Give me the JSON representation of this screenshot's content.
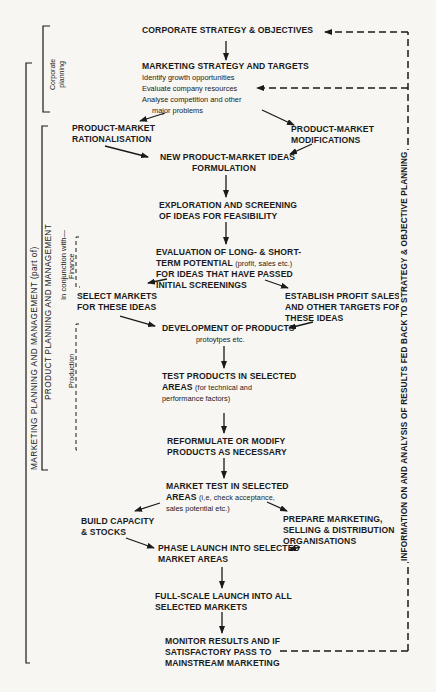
{
  "diagram": {
    "type": "flowchart",
    "nodes": {
      "corporate_strategy": "CORPORATE STRATEGY & OBJECTIVES",
      "marketing_strategy": {
        "title": "MARKETING STRATEGY AND TARGETS",
        "lines": [
          "Identify growth opportunities",
          "Evaluate company resources",
          "Analyse competition and other",
          "major problems"
        ]
      },
      "pm_rationalisation": [
        "PRODUCT-MARKET",
        "RATIONALISATION"
      ],
      "pm_modifications": [
        "PRODUCT-MARKET",
        "MODIFICATIONS"
      ],
      "new_ideas": [
        "NEW PRODUCT-MARKET IDEAS",
        "FORMULATION"
      ],
      "exploration": [
        "EXPLORATION AND SCREENING",
        "OF IDEAS FOR FEASIBILITY"
      ],
      "evaluation": {
        "line1": "EVALUATION OF LONG- & SHORT-",
        "line2_bold": "TERM POTENTIAL",
        "line2_small": "(profit, sales etc.)",
        "line3": "FOR IDEAS THAT HAVE PASSED",
        "line4": "INITIAL SCREENINGS"
      },
      "select_markets": [
        "SELECT MARKETS",
        "FOR THESE IDEAS"
      ],
      "establish_targets": [
        "ESTABLISH PROFIT SALES",
        "AND OTHER TARGETS FOR",
        "THESE IDEAS"
      ],
      "development": {
        "title": "DEVELOPMENT OF PRODUCTS",
        "sub": "protoytpes etc."
      },
      "test_products": {
        "line1": "TEST PRODUCTS IN SELECTED",
        "line2_bold": "AREAS",
        "line2_small": "(for technical and",
        "line3_small": "performance factors)"
      },
      "reformulate": [
        "REFORMULATE OR MODIFY",
        "PRODUCTS AS NECESSARY"
      ],
      "market_test": {
        "line1": "MARKET TEST IN SELECTED",
        "line2_bold": "AREAS",
        "line2_small": "(i,e, check acceptance,",
        "line3_small": "sales potential etc.)"
      },
      "build_capacity": [
        "BUILD CAPACITY",
        "& STOCKS"
      ],
      "prepare_marketing": [
        "PREPARE MARKETING,",
        "SELLING & DISTRIBUTION",
        "ORGANISATIONS"
      ],
      "phase_launch": [
        "PHASE LAUNCH INTO SELECTED",
        "MARKET AREAS"
      ],
      "full_scale": [
        "FULL-SCALE LAUNCH INTO ALL",
        "SELECTED MARKETS"
      ],
      "monitor": [
        "MONITOR RESULTS AND IF",
        "SATISFACTORY PASS TO",
        "MAINSTREAM MARKETING"
      ]
    },
    "side_labels": {
      "corporate_planning": [
        "Corporate",
        "planning"
      ],
      "marketing_planning": "MARKETING PLANNING AND MANAGEMENT (part of)",
      "product_planning": "PRODUCT PLANNING AND MANAGEMENT",
      "in_conjunction": "In conjunction with—",
      "finance": "Finance",
      "production": "Production",
      "feedback": "INFORMATION ON AND ANALYSIS OF RESULTS FED BACK TO STRATEGY & OBJECTIVE PLANNING"
    },
    "edges": [
      [
        "corporate_strategy",
        "marketing_strategy"
      ],
      [
        "marketing_strategy",
        "pm_rationalisation"
      ],
      [
        "marketing_strategy",
        "pm_modifications"
      ],
      [
        "pm_rationalisation",
        "new_ideas"
      ],
      [
        "pm_modifications",
        "new_ideas"
      ],
      [
        "new_ideas",
        "exploration"
      ],
      [
        "exploration",
        "evaluation"
      ],
      [
        "evaluation",
        "select_markets"
      ],
      [
        "evaluation",
        "establish_targets"
      ],
      [
        "select_markets",
        "development"
      ],
      [
        "establish_targets",
        "development"
      ],
      [
        "development",
        "test_products"
      ],
      [
        "test_products",
        "reformulate"
      ],
      [
        "reformulate",
        "market_test"
      ],
      [
        "market_test",
        "build_capacity"
      ],
      [
        "market_test",
        "prepare_marketing"
      ],
      [
        "build_capacity",
        "phase_launch"
      ],
      [
        "prepare_marketing",
        "phase_launch"
      ],
      [
        "phase_launch",
        "full_scale"
      ],
      [
        "full_scale",
        "monitor"
      ],
      [
        "monitor",
        "corporate_strategy (feedback, dashed)"
      ],
      [
        "monitor",
        "marketing_strategy (feedback, dashed)"
      ]
    ]
  }
}
